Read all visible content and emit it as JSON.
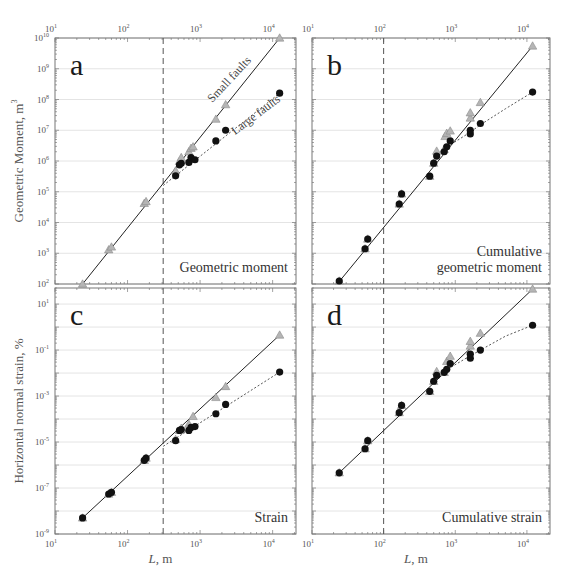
{
  "chart_data": [
    {
      "id": "a",
      "type": "scatter",
      "panel_label": "a",
      "annotation": [
        "Geometric moment"
      ],
      "xscale": "log",
      "yscale": "log",
      "xlim": [
        10,
        21000
      ],
      "ylim": [
        100,
        10000000000.0
      ],
      "xticks": [
        10,
        100,
        1000,
        10000
      ],
      "xtick_labels": [
        {
          "base": "10",
          "exp": "1"
        },
        {
          "base": "10",
          "exp": "2"
        },
        {
          "base": "10",
          "exp": "3"
        },
        {
          "base": "10",
          "exp": "4"
        }
      ],
      "xtick_position": "top",
      "yticks": [
        100,
        1000,
        10000,
        100000,
        1000000.0,
        10000000.0,
        100000000.0,
        1000000000.0,
        10000000000.0
      ],
      "ytick_labels": [
        {
          "base": "10",
          "exp": "2"
        },
        {
          "base": "10",
          "exp": "3"
        },
        {
          "base": "10",
          "exp": "4"
        },
        {
          "base": "10",
          "exp": "5"
        },
        {
          "base": "10",
          "exp": "6"
        },
        {
          "base": "10",
          "exp": "7"
        },
        {
          "base": "10",
          "exp": "8"
        },
        {
          "base": "10",
          "exp": "9"
        },
        {
          "base": "10",
          "exp": "10"
        }
      ],
      "ylabel": "Geometric Moment, m",
      "ylabel_sup": "3",
      "xlabel": "",
      "grid": "horizontal",
      "vline": 310,
      "series": [
        {
          "name": "Small faults",
          "marker": "triangle",
          "color": "#a9a9a9",
          "points": [
            [
              24,
              100
            ],
            [
              55,
              1300
            ],
            [
              60,
              1600
            ],
            [
              170,
              42000
            ],
            [
              180,
              48000
            ],
            [
              460,
              480000
            ],
            [
              520,
              980000
            ],
            [
              550,
              1300000
            ],
            [
              700,
              2000000
            ],
            [
              750,
              2600000
            ],
            [
              800,
              2900000
            ],
            [
              1650,
              23000000
            ],
            [
              2250,
              68000000
            ],
            [
              12500,
              10000000000.0
            ]
          ]
        },
        {
          "name": "Large faults",
          "marker": "circle",
          "color": "#111111",
          "points": [
            [
              460,
              330000
            ],
            [
              520,
              750000
            ],
            [
              550,
              840000
            ],
            [
              700,
              900000
            ],
            [
              750,
              1300000
            ],
            [
              850,
              1100000
            ],
            [
              1650,
              4500000
            ],
            [
              2250,
              10000000
            ],
            [
              12500,
              160000000
            ]
          ]
        }
      ],
      "fits": [
        {
          "name": "Small faults",
          "style": "solid",
          "points": [
            [
              24,
              100
            ],
            [
              12500,
              10000000000.0
            ]
          ],
          "label": "Small faults"
        },
        {
          "name": "Large faults",
          "style": "dotted",
          "points": [
            [
              310,
              160000
            ],
            [
              12500,
              160000000
            ]
          ],
          "label": "Large faults"
        }
      ]
    },
    {
      "id": "b",
      "type": "scatter",
      "panel_label": "b",
      "annotation": [
        "Cumulative",
        "geometric moment"
      ],
      "xscale": "log",
      "yscale": "log",
      "xlim": [
        10,
        21000
      ],
      "ylim": [
        100,
        10000000000.0
      ],
      "xticks": [
        10,
        100,
        1000,
        10000
      ],
      "xtick_labels": [
        {
          "base": "10",
          "exp": "1"
        },
        {
          "base": "10",
          "exp": "2"
        },
        {
          "base": "10",
          "exp": "3"
        },
        {
          "base": "10",
          "exp": "4"
        }
      ],
      "xtick_position": "top",
      "yticks": [],
      "ytick_labels": [],
      "grid": "horizontal",
      "vline": 100,
      "series": [
        {
          "name": "Small faults (cumulative)",
          "marker": "triangle",
          "color": "#a9a9a9",
          "points": [
            [
              24,
              125
            ],
            [
              55,
              1400
            ],
            [
              60,
              2900
            ],
            [
              165,
              40000
            ],
            [
              178,
              85000
            ],
            [
              440,
              320000
            ],
            [
              500,
              850000
            ],
            [
              550,
              2100000
            ],
            [
              700,
              2400000
            ],
            [
              720,
              6300000
            ],
            [
              760,
              8000000
            ],
            [
              850,
              9500000
            ],
            [
              1620,
              25000000
            ],
            [
              1620,
              37000000
            ],
            [
              2240,
              80000000
            ],
            [
              12000,
              5500000000.0
            ]
          ]
        },
        {
          "name": "Large faults (cumulative)",
          "marker": "circle",
          "color": "#111111",
          "points": [
            [
              24,
              125
            ],
            [
              55,
              1400
            ],
            [
              60,
              2900
            ],
            [
              165,
              40000
            ],
            [
              178,
              85000
            ],
            [
              440,
              320000
            ],
            [
              500,
              850000
            ],
            [
              550,
              1450000
            ],
            [
              700,
              2000000
            ],
            [
              760,
              2900000
            ],
            [
              850,
              4500000
            ],
            [
              1620,
              7600000
            ],
            [
              1620,
              10000000
            ],
            [
              2240,
              16600000
            ],
            [
              12000,
              174000000
            ]
          ]
        }
      ],
      "fits": [
        {
          "name": "Small faults",
          "style": "solid",
          "points": [
            [
              24,
              120
            ],
            [
              12000,
              5500000000.0
            ]
          ]
        },
        {
          "name": "Large faults",
          "style": "dotted",
          "points": [
            [
              700,
              2500000
            ],
            [
              1600,
              8500000
            ],
            [
              2240,
              15000000
            ],
            [
              5000,
              50000000
            ],
            [
              12000,
              174000000
            ]
          ]
        }
      ]
    },
    {
      "id": "c",
      "type": "scatter",
      "panel_label": "c",
      "annotation": [
        "Strain"
      ],
      "xscale": "log",
      "yscale": "log",
      "xlim": [
        10,
        21000
      ],
      "ylim": [
        1e-09,
        50
      ],
      "xticks": [
        10,
        100,
        1000,
        10000
      ],
      "xtick_labels": [
        {
          "base": "10",
          "exp": "1"
        },
        {
          "base": "10",
          "exp": "2"
        },
        {
          "base": "10",
          "exp": "3"
        },
        {
          "base": "10",
          "exp": "4"
        }
      ],
      "xtick_position": "bottom",
      "yticks": [
        10,
        0.1,
        0.001,
        1e-05,
        1e-07,
        1e-09
      ],
      "ytick_labels": [
        {
          "base": "10",
          "exp": "1"
        },
        {
          "base": "10",
          "exp": "-1"
        },
        {
          "base": "10",
          "exp": "-3"
        },
        {
          "base": "10",
          "exp": "-5"
        },
        {
          "base": "10",
          "exp": "-7"
        },
        {
          "base": "10",
          "exp": "-9"
        }
      ],
      "ylabel": "Horizontal normal strain, %",
      "xlabel_italic": "L",
      "xlabel_rest": ", m",
      "grid": "horizontal",
      "vline": 310,
      "series": [
        {
          "name": "Small faults",
          "marker": "triangle",
          "color": "#a9a9a9",
          "points": [
            [
              24,
              5e-09
            ],
            [
              55,
              5.5e-08
            ],
            [
              60,
              6.5e-08
            ],
            [
              170,
              1.6e-06
            ],
            [
              180,
              2e-06
            ],
            [
              460,
              1.3e-05
            ],
            [
              520,
              3.2e-05
            ],
            [
              550,
              4e-05
            ],
            [
              700,
              6e-05
            ],
            [
              800,
              0.00013
            ],
            [
              1650,
              0.00087
            ],
            [
              2250,
              0.0026
            ],
            [
              12500,
              0.45
            ]
          ]
        },
        {
          "name": "Large faults",
          "marker": "circle",
          "color": "#111111",
          "points": [
            [
              24,
              5e-09
            ],
            [
              55,
              5.5e-08
            ],
            [
              60,
              6.5e-08
            ],
            [
              170,
              1.6e-06
            ],
            [
              180,
              2e-06
            ],
            [
              460,
              1.15e-05
            ],
            [
              520,
              3.2e-05
            ],
            [
              550,
              3.5e-05
            ],
            [
              700,
              3.2e-05
            ],
            [
              750,
              4.3e-05
            ],
            [
              850,
              4.7e-05
            ],
            [
              1650,
              0.00017
            ],
            [
              2250,
              0.00043
            ],
            [
              12500,
              0.011
            ]
          ]
        }
      ],
      "fits": [
        {
          "name": "Small faults",
          "style": "solid",
          "points": [
            [
              24,
              5e-09
            ],
            [
              12500,
              0.45
            ]
          ]
        },
        {
          "name": "Large faults",
          "style": "dotted",
          "points": [
            [
              310,
              6.5e-06
            ],
            [
              12500,
              0.011
            ]
          ]
        }
      ]
    },
    {
      "id": "d",
      "type": "scatter",
      "panel_label": "d",
      "annotation": [
        "Cumulative strain"
      ],
      "xscale": "log",
      "yscale": "log",
      "xlim": [
        10,
        21000
      ],
      "ylim": [
        1e-09,
        50
      ],
      "xticks": [
        10,
        100,
        1000,
        10000
      ],
      "xtick_labels": [
        {
          "base": "10",
          "exp": "1"
        },
        {
          "base": "10",
          "exp": "2"
        },
        {
          "base": "10",
          "exp": "3"
        },
        {
          "base": "10",
          "exp": "4"
        }
      ],
      "xtick_position": "bottom",
      "yticks": [],
      "ytick_labels": [],
      "xlabel_italic": "L",
      "xlabel_rest": ", m",
      "grid": "horizontal",
      "vline": 100,
      "series": [
        {
          "name": "Small faults (cumulative)",
          "marker": "triangle",
          "color": "#a9a9a9",
          "points": [
            [
              24,
              4.6e-07
            ],
            [
              55,
              5.1e-06
            ],
            [
              60,
              1.15e-05
            ],
            [
              165,
              0.00019
            ],
            [
              178,
              0.00039
            ],
            [
              440,
              0.0016
            ],
            [
              500,
              0.0044
            ],
            [
              550,
              0.0117
            ],
            [
              700,
              0.0107
            ],
            [
              760,
              0.032
            ],
            [
              850,
              0.054
            ],
            [
              1620,
              0.15
            ],
            [
              1620,
              0.24
            ],
            [
              2240,
              0.54
            ],
            [
              12000,
              45
            ]
          ]
        },
        {
          "name": "Large faults (cumulative)",
          "marker": "circle",
          "color": "#111111",
          "points": [
            [
              24,
              4.6e-07
            ],
            [
              55,
              5.1e-06
            ],
            [
              60,
              1.15e-05
            ],
            [
              165,
              0.00019
            ],
            [
              178,
              0.00039
            ],
            [
              440,
              0.0016
            ],
            [
              500,
              0.0044
            ],
            [
              550,
              0.0079
            ],
            [
              700,
              0.0107
            ],
            [
              760,
              0.0145
            ],
            [
              850,
              0.026
            ],
            [
              1620,
              0.044
            ],
            [
              1620,
              0.066
            ],
            [
              2240,
              0.1
            ],
            [
              12000,
              1.2
            ]
          ]
        }
      ],
      "fits": [
        {
          "name": "Small faults",
          "style": "solid",
          "points": [
            [
              24,
              4.6e-07
            ],
            [
              12000,
              45
            ]
          ]
        },
        {
          "name": "Large faults",
          "style": "dotted",
          "points": [
            [
              700,
              0.012
            ],
            [
              1600,
              0.055
            ],
            [
              2240,
              0.1
            ],
            [
              5000,
              0.4
            ],
            [
              12000,
              1.2
            ]
          ]
        }
      ]
    }
  ]
}
